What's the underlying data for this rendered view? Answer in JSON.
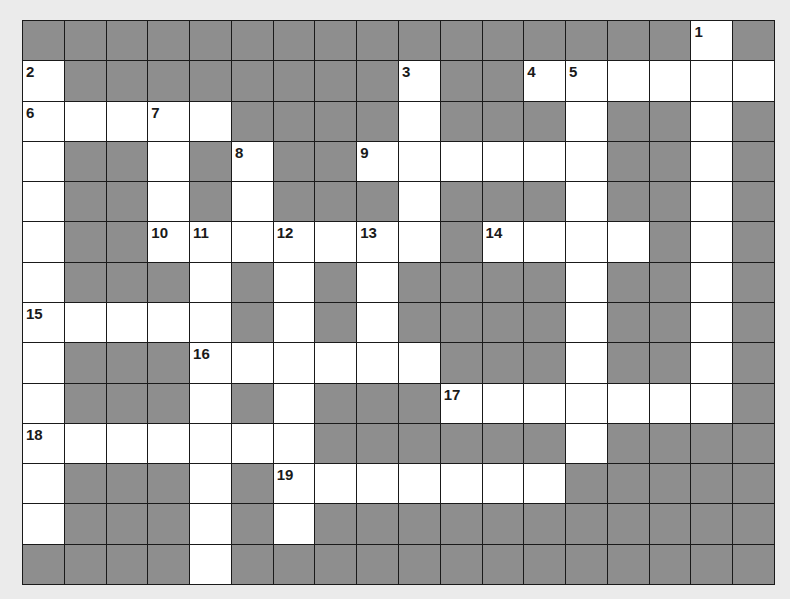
{
  "puzzle": {
    "rows": 14,
    "cols": 18,
    "colors": {
      "black": "#8e8e8e",
      "white": "#ffffff",
      "border": "#1a1a1a",
      "page": "#ebebeb"
    },
    "layout": [
      "BBBBBBBBBBBBBBBBWB",
      "WBBBBBBBBWBBWWWWWW",
      "WWWWWBBBBWBBBWBBWB",
      "WBBWBWBBWWWWWWBBWB",
      "WBBWBWBBBWBBBWBBWB",
      "WBBWWWWWWWBWWWWBWB",
      "WBBBWBWBWBBBBWBBWB",
      "WWWWWBWBWBBBBWBBWB",
      "WBBBWWWWWWBBBWBBWB",
      "WBBBWBWBBBWWWWWWWB",
      "WWWWWWWBBBBBBWBBBB",
      "WBBBWBWWWWWWWBBBBB",
      "WBBBWBWBBBBBBBBBBB",
      "BBBBWBBBBBBBBBBBBB"
    ],
    "numbers": [
      {
        "n": "1",
        "r": 0,
        "c": 16
      },
      {
        "n": "2",
        "r": 1,
        "c": 0
      },
      {
        "n": "3",
        "r": 1,
        "c": 9
      },
      {
        "n": "4",
        "r": 1,
        "c": 12
      },
      {
        "n": "5",
        "r": 1,
        "c": 13
      },
      {
        "n": "6",
        "r": 2,
        "c": 0
      },
      {
        "n": "7",
        "r": 2,
        "c": 3
      },
      {
        "n": "8",
        "r": 3,
        "c": 5
      },
      {
        "n": "9",
        "r": 3,
        "c": 8
      },
      {
        "n": "10",
        "r": 5,
        "c": 3
      },
      {
        "n": "11",
        "r": 5,
        "c": 4
      },
      {
        "n": "12",
        "r": 5,
        "c": 6
      },
      {
        "n": "13",
        "r": 5,
        "c": 8
      },
      {
        "n": "14",
        "r": 5,
        "c": 11
      },
      {
        "n": "15",
        "r": 7,
        "c": 0
      },
      {
        "n": "16",
        "r": 8,
        "c": 4
      },
      {
        "n": "17",
        "r": 9,
        "c": 10
      },
      {
        "n": "18",
        "r": 10,
        "c": 0
      },
      {
        "n": "19",
        "r": 11,
        "c": 6
      }
    ]
  }
}
